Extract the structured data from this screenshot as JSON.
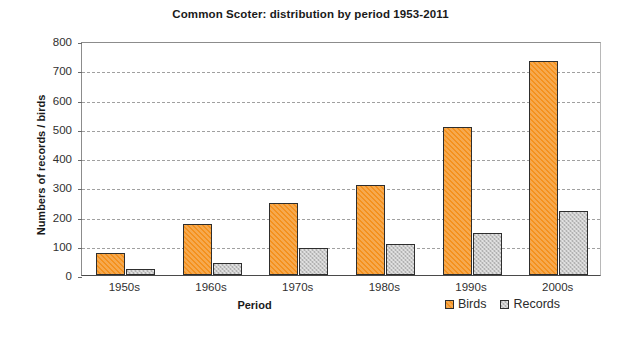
{
  "chart_data": {
    "type": "bar",
    "title": "Common Scoter: distribution by period 1953-2011",
    "xlabel": "Period",
    "ylabel": "Numbers of records / birds",
    "categories": [
      "1950s",
      "1960s",
      "1970s",
      "1980s",
      "1990s",
      "2000s"
    ],
    "series": [
      {
        "name": "Birds",
        "color": "#f4911e",
        "values": [
          75,
          175,
          247,
          307,
          505,
          730
        ]
      },
      {
        "name": "Records",
        "color": "#c9c9c9",
        "values": [
          20,
          42,
          92,
          105,
          143,
          218
        ]
      }
    ],
    "ylim": [
      0,
      800
    ],
    "ytick_step": 100,
    "yticks": [
      800,
      700,
      600,
      500,
      400,
      300,
      200,
      100,
      0
    ],
    "grid": true,
    "legend_position": "bottom-right"
  },
  "legend": {
    "entries": [
      {
        "label": "Birds"
      },
      {
        "label": "Records"
      }
    ]
  }
}
